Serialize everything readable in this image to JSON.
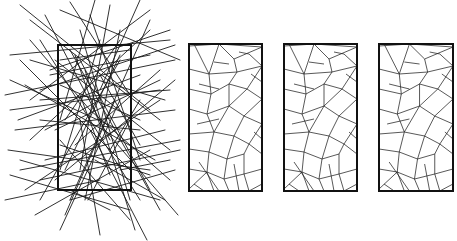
{
  "chart_data": {
    "type": "diagram",
    "title": "",
    "colors": {
      "stroke": "#1a1a1a",
      "frame": "#111111",
      "background": "#ffffff"
    },
    "panels": [
      {
        "id": "random-lines",
        "frame": {
          "x": 58,
          "y": 45,
          "w": 73,
          "h": 145
        },
        "segments": [
          [
            20,
            5,
            150,
            110
          ],
          [
            70,
            2,
            130,
            95
          ],
          [
            95,
            0,
            60,
            120
          ],
          [
            140,
            0,
            100,
            90
          ],
          [
            150,
            10,
            30,
            100
          ],
          [
            170,
            30,
            50,
            70
          ],
          [
            10,
            55,
            170,
            40
          ],
          [
            30,
            20,
            160,
            120
          ],
          [
            110,
            5,
            80,
            170
          ],
          [
            60,
            10,
            180,
            60
          ],
          [
            5,
            95,
            175,
            60
          ],
          [
            10,
            110,
            160,
            90
          ],
          [
            15,
            130,
            175,
            110
          ],
          [
            8,
            150,
            150,
            170
          ],
          [
            20,
            170,
            180,
            140
          ],
          [
            10,
            80,
            120,
            130
          ],
          [
            40,
            40,
            140,
            200
          ],
          [
            150,
            20,
            70,
            200
          ],
          [
            55,
            60,
            170,
            150
          ],
          [
            25,
            190,
            160,
            100
          ],
          [
            5,
            200,
            100,
            180
          ],
          [
            35,
            215,
            150,
            150
          ],
          [
            60,
            230,
            120,
            100
          ],
          [
            100,
            235,
            80,
            120
          ],
          [
            147,
            240,
            90,
            130
          ],
          [
            130,
            220,
            60,
            140
          ],
          [
            180,
            150,
            40,
            180
          ],
          [
            175,
            170,
            70,
            200
          ],
          [
            160,
            200,
            20,
            160
          ],
          [
            10,
            175,
            130,
            210
          ],
          [
            45,
            15,
            110,
            140
          ],
          [
            120,
            30,
            85,
            200
          ],
          [
            90,
            15,
            140,
            160
          ],
          [
            160,
            80,
            55,
            130
          ],
          [
            20,
            60,
            130,
            170
          ],
          [
            40,
            100,
            170,
            90
          ],
          [
            120,
            60,
            40,
            200
          ],
          [
            70,
            50,
            160,
            210
          ],
          [
            55,
            180,
            175,
            80
          ],
          [
            30,
            140,
            150,
            30
          ],
          [
            80,
            30,
            130,
            200
          ],
          [
            100,
            40,
            60,
            170
          ],
          [
            175,
            45,
            40,
            90
          ],
          [
            165,
            100,
            30,
            60
          ],
          [
            150,
            190,
            80,
            60
          ],
          [
            18,
            120,
            140,
            75
          ],
          [
            25,
            85,
            155,
            160
          ],
          [
            65,
            120,
            120,
            40
          ],
          [
            75,
            145,
            160,
            70
          ],
          [
            45,
            160,
            165,
            130
          ],
          [
            85,
            70,
            135,
            230
          ],
          [
            115,
            100,
            65,
            215
          ],
          [
            60,
            85,
            140,
            120
          ],
          [
            90,
            110,
            170,
            180
          ],
          [
            30,
            40,
            90,
            110
          ],
          [
            105,
            130,
            178,
            215
          ],
          [
            65,
            170,
            120,
            55
          ],
          [
            50,
            75,
            150,
            55
          ],
          [
            140,
            130,
            40,
            120
          ],
          [
            95,
            160,
            165,
            200
          ],
          [
            70,
            190,
            110,
            210
          ],
          [
            45,
            130,
            100,
            100
          ],
          [
            120,
            170,
            170,
            160
          ],
          [
            80,
            95,
            110,
            175
          ],
          [
            100,
            75,
            140,
            145
          ],
          [
            130,
            50,
            60,
            60
          ],
          [
            60,
            145,
            150,
            175
          ],
          [
            88,
            200,
            130,
            120
          ],
          [
            75,
            55,
            100,
            125
          ],
          [
            110,
            150,
            140,
            100
          ]
        ]
      },
      {
        "id": "tessellation-1",
        "frame": {
          "x": 189,
          "y": 44,
          "w": 73,
          "h": 147
        }
      },
      {
        "id": "tessellation-2",
        "frame": {
          "x": 284,
          "y": 44,
          "w": 73,
          "h": 147
        }
      },
      {
        "id": "tessellation-3",
        "frame": {
          "x": 379,
          "y": 44,
          "w": 74,
          "h": 147
        }
      }
    ],
    "tessellation_segments_relative": [
      [
        0,
        2,
        30,
        0
      ],
      [
        30,
        0,
        73,
        3
      ],
      [
        5,
        0,
        20,
        30
      ],
      [
        0,
        25,
        20,
        30
      ],
      [
        20,
        30,
        30,
        0
      ],
      [
        20,
        30,
        48,
        28
      ],
      [
        30,
        0,
        45,
        15
      ],
      [
        45,
        15,
        73,
        3
      ],
      [
        45,
        15,
        48,
        28
      ],
      [
        48,
        28,
        73,
        22
      ],
      [
        60,
        10,
        73,
        22
      ],
      [
        50,
        8,
        60,
        10
      ],
      [
        0,
        45,
        22,
        50
      ],
      [
        20,
        30,
        22,
        50
      ],
      [
        22,
        50,
        40,
        40
      ],
      [
        40,
        40,
        48,
        28
      ],
      [
        40,
        40,
        58,
        45
      ],
      [
        58,
        45,
        73,
        22
      ],
      [
        58,
        45,
        73,
        55
      ],
      [
        22,
        50,
        18,
        70
      ],
      [
        0,
        65,
        18,
        70
      ],
      [
        18,
        70,
        40,
        62
      ],
      [
        40,
        40,
        40,
        62
      ],
      [
        40,
        62,
        58,
        45
      ],
      [
        40,
        62,
        55,
        72
      ],
      [
        55,
        72,
        73,
        55
      ],
      [
        55,
        72,
        73,
        80
      ],
      [
        18,
        70,
        25,
        88
      ],
      [
        0,
        90,
        25,
        88
      ],
      [
        25,
        88,
        40,
        62
      ],
      [
        25,
        88,
        45,
        92
      ],
      [
        45,
        92,
        55,
        72
      ],
      [
        45,
        92,
        60,
        100
      ],
      [
        60,
        100,
        73,
        80
      ],
      [
        60,
        100,
        73,
        110
      ],
      [
        0,
        105,
        20,
        108
      ],
      [
        20,
        108,
        25,
        88
      ],
      [
        20,
        108,
        38,
        115
      ],
      [
        38,
        115,
        45,
        92
      ],
      [
        38,
        115,
        55,
        110
      ],
      [
        55,
        110,
        60,
        100
      ],
      [
        0,
        125,
        18,
        128
      ],
      [
        18,
        128,
        20,
        108
      ],
      [
        18,
        128,
        35,
        135
      ],
      [
        35,
        135,
        38,
        115
      ],
      [
        35,
        135,
        55,
        130
      ],
      [
        55,
        130,
        55,
        110
      ],
      [
        55,
        130,
        73,
        125
      ],
      [
        0,
        145,
        18,
        128
      ],
      [
        18,
        128,
        25,
        147
      ],
      [
        35,
        135,
        40,
        147
      ],
      [
        55,
        130,
        60,
        147
      ],
      [
        60,
        147,
        73,
        140
      ],
      [
        10,
        118,
        30,
        147
      ],
      [
        45,
        120,
        50,
        147
      ],
      [
        8,
        80,
        30,
        75
      ],
      [
        10,
        40,
        30,
        45
      ],
      [
        62,
        30,
        73,
        38
      ],
      [
        65,
        88,
        73,
        95
      ],
      [
        25,
        18,
        40,
        20
      ],
      [
        5,
        140,
        15,
        147
      ]
    ]
  }
}
